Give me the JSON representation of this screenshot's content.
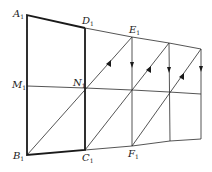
{
  "diagram": {
    "labels": {
      "A": {
        "main": "A",
        "sub": "1"
      },
      "D": {
        "main": "D",
        "sub": "1"
      },
      "E": {
        "main": "E",
        "sub": "1"
      },
      "M": {
        "main": "M",
        "sub": "1"
      },
      "N": {
        "main": "N",
        "sub": "1"
      },
      "B": {
        "main": "B",
        "sub": "1"
      },
      "C": {
        "main": "C",
        "sub": "1"
      },
      "F": {
        "main": "F",
        "sub": "1"
      }
    },
    "colors": {
      "line": "#2a2a2a",
      "bold": "#1a1a1a",
      "background": "#ffffff"
    }
  }
}
